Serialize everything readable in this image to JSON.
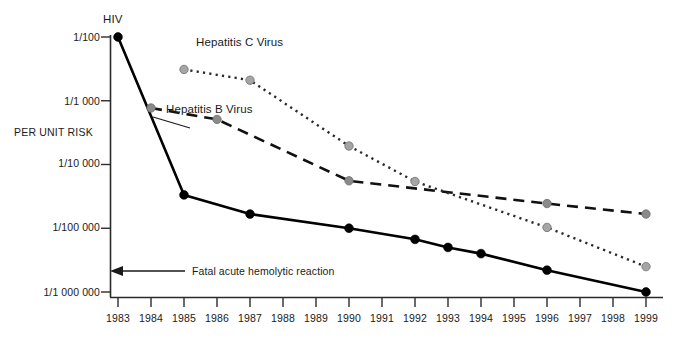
{
  "chart_data": {
    "type": "line",
    "title": "",
    "xlabel": "",
    "ylabel": "PER UNIT RISK",
    "yscale": "log",
    "ylim": [
      1e-06,
      0.01
    ],
    "ytick_labels": [
      "1/100",
      "1/1 000",
      "1/10 000",
      "1/100 000",
      "1/1 000 000"
    ],
    "ytick_values": [
      0.01,
      0.001,
      0.0001,
      1e-05,
      1e-06
    ],
    "x": [
      1983,
      1984,
      1985,
      1986,
      1987,
      1988,
      1989,
      1990,
      1991,
      1992,
      1993,
      1994,
      1995,
      1996,
      1997,
      1998,
      1999
    ],
    "xtick_labels": [
      "1983",
      "1984",
      "1985",
      "1986",
      "1987",
      "1988",
      "1989",
      "1990",
      "1991",
      "1992",
      "1993",
      "1994",
      "1995",
      "1996",
      "1997",
      "1998",
      "1999"
    ],
    "grid": false,
    "legend_position": "inline-labels",
    "series": [
      {
        "name": "HIV",
        "linestyle": "solid",
        "color": "#000000",
        "marker": "circle",
        "marker_color": "#000000",
        "points": [
          {
            "x": 1983,
            "y": 0.01,
            "label": "1/100"
          },
          {
            "x": 1985,
            "y": 3.33e-05,
            "label": "1/30 000"
          },
          {
            "x": 1987,
            "y": 1.67e-05,
            "label": "1/60 000"
          },
          {
            "x": 1990,
            "y": 1e-05,
            "label": "1/100 000"
          },
          {
            "x": 1992,
            "y": 6.7e-06,
            "label": "1/150 000"
          },
          {
            "x": 1993,
            "y": 5e-06,
            "label": "1/200 000"
          },
          {
            "x": 1994,
            "y": 4e-06,
            "label": "1/250 000"
          },
          {
            "x": 1996,
            "y": 2.2e-06,
            "label": "1/450 000"
          },
          {
            "x": 1999,
            "y": 1e-06,
            "label": "1/1 000 000"
          }
        ]
      },
      {
        "name": "Hepatitis B Virus",
        "linestyle": "dashed",
        "color": "#111111",
        "marker": "circle",
        "marker_color": "#8a8a8a",
        "points": [
          {
            "x": 1984,
            "y": 0.00077,
            "label": "1/1 300"
          },
          {
            "x": 1986,
            "y": 0.00051,
            "label": "1/2 000"
          },
          {
            "x": 1990,
            "y": 5.55e-05,
            "label": "1/18 000"
          },
          {
            "x": 1996,
            "y": 2.44e-05,
            "label": "1/41 000"
          },
          {
            "x": 1999,
            "y": 1.67e-05,
            "label": "1/60 000"
          }
        ]
      },
      {
        "name": "Hepatitis C Virus",
        "linestyle": "dotted",
        "color": "#2a2a2a",
        "marker": "circle",
        "marker_color": "#a5a5a5",
        "points": [
          {
            "x": 1985,
            "y": 0.0031,
            "label": "1/320"
          },
          {
            "x": 1987,
            "y": 0.0021,
            "label": "1/480"
          },
          {
            "x": 1990,
            "y": 0.000195,
            "label": "1/5 100"
          },
          {
            "x": 1992,
            "y": 5.41e-05,
            "label": "1/18 500"
          },
          {
            "x": 1996,
            "y": 1.03e-05,
            "label": "1/97 000"
          },
          {
            "x": 1999,
            "y": 2.5e-06,
            "label": "1/400 000"
          }
        ]
      }
    ],
    "annotations": [
      {
        "name": "fatal-acute-hemolytic-reaction",
        "text": "Fatal acute hemolytic reaction",
        "y": 2.5e-06,
        "arrow": "left"
      },
      {
        "name": "hiv-series-label",
        "text": "HIV"
      },
      {
        "name": "hbv-series-label",
        "text": "Hepatitis B Virus"
      },
      {
        "name": "hcv-series-label",
        "text": "Hepatitis C Virus"
      }
    ]
  },
  "labels": {
    "y_axis_title": "PER UNIT RISK",
    "hiv": "HIV",
    "hbv": "Hepatitis B Virus",
    "hcv": "Hepatitis C Virus",
    "fatal_reaction": "Fatal acute hemolytic reaction",
    "ytick_0": "1/100",
    "ytick_1": "1/1 000",
    "ytick_2": "1/10 000",
    "ytick_3": "1/100 000",
    "ytick_4": "1/1 000 000"
  },
  "colors": {
    "axis": "#2b2b2b",
    "hiv": "#000000",
    "hbv_marker": "#8a8a8a",
    "hcv_marker": "#a5a5a5",
    "background": "#ffffff"
  }
}
